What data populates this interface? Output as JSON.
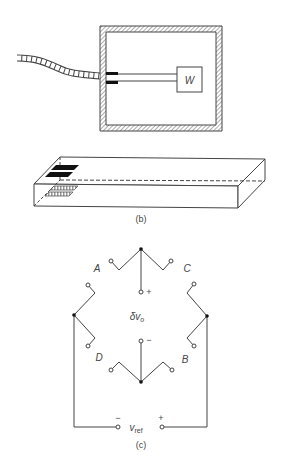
{
  "figure": {
    "panel_b": {
      "mass_label": "W",
      "caption": "(b)"
    },
    "panel_c": {
      "arm_labels": {
        "A": "A",
        "B": "B",
        "C": "C",
        "D": "D"
      },
      "output_label_main": "δv",
      "output_label_sub": "o",
      "output_plus": "+",
      "output_minus": "−",
      "ref_label_main": "v",
      "ref_label_sub": "ref",
      "ref_minus": "−",
      "ref_plus": "+",
      "caption": "(c)"
    },
    "colors": {
      "line": "#444444",
      "hatch": "#777777",
      "gauge_dark": "#111111"
    }
  }
}
